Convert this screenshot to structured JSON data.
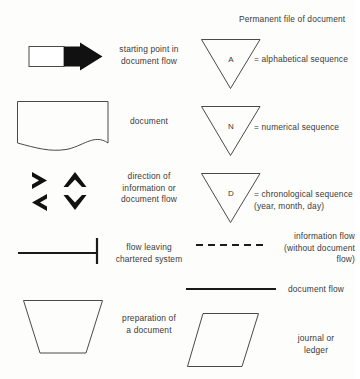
{
  "page": {
    "background_color": "#fdfdfc",
    "ink_color": "#2b2b2b"
  },
  "header": {
    "permanent_file_label": "Permanent file of document"
  },
  "left_column": [
    {
      "key": "starting-point",
      "symbol": "block-arrow-right",
      "label": "starting point in\ndocument flow"
    },
    {
      "key": "document",
      "symbol": "document-wavy-bottom",
      "label": "document"
    },
    {
      "key": "direction",
      "symbol": "four-chevrons",
      "label": "direction of\ninformation or\ndocument flow"
    },
    {
      "key": "flow-leaving",
      "symbol": "line-with-end-bar",
      "label": "flow leaving\nchartered system"
    },
    {
      "key": "preparation",
      "symbol": "inverted-trapezoid",
      "label": "preparation of\na document"
    }
  ],
  "right_column": [
    {
      "key": "alphabetical",
      "symbol": "inverted-triangle",
      "symbol_letter": "A",
      "label": "= alphabetical sequence"
    },
    {
      "key": "numerical",
      "symbol": "inverted-triangle",
      "symbol_letter": "N",
      "label": "= numerical sequence"
    },
    {
      "key": "chronological",
      "symbol": "inverted-triangle",
      "symbol_letter": "D",
      "label": "= chronological sequence\n(year, month, day)"
    },
    {
      "key": "information-flow",
      "symbol": "dashed-line",
      "label": "information flow\n(without document\nflow)"
    },
    {
      "key": "document-flow",
      "symbol": "solid-line",
      "label": "document flow"
    },
    {
      "key": "journal-ledger",
      "symbol": "parallelogram",
      "label": "journal or\nledger"
    }
  ]
}
